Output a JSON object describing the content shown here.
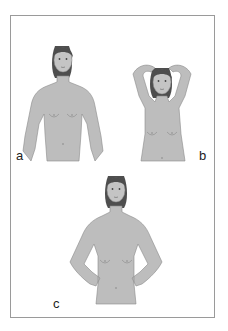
{
  "figure": {
    "panels": [
      {
        "id": "a",
        "label": "a",
        "pose": "arms relaxed at sides"
      },
      {
        "id": "b",
        "label": "b",
        "pose": "hands clasped behind head"
      },
      {
        "id": "c",
        "label": "c",
        "pose": "hands pressed on hips"
      }
    ],
    "colors": {
      "skin": "#bdbdbd",
      "outline": "#8a8a8a",
      "hair": "#4e4e4e",
      "frame": "#9a9a9a",
      "label": "#222222"
    }
  }
}
